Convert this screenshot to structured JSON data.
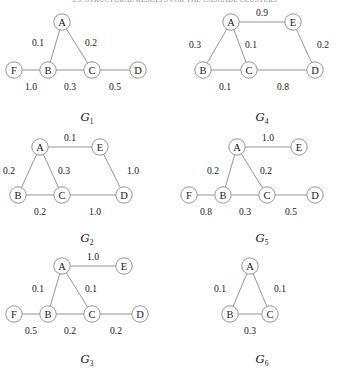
{
  "header": {
    "running_title": "3.3. STRUCTURAL RESULTS FOR THE CASCADE CLUSTERS"
  },
  "figure": {
    "node_radius": 8.2,
    "stroke_color": "#8a8a92",
    "background": "#ffffff",
    "graphs": [
      {
        "id": "G1",
        "caption_letter": "G",
        "caption_subscript": "1",
        "nodes": [
          {
            "label": "A",
            "x": 62,
            "y": 14
          },
          {
            "label": "B",
            "x": 48,
            "y": 62
          },
          {
            "label": "C",
            "x": 92,
            "y": 62
          },
          {
            "label": "D",
            "x": 138,
            "y": 62
          },
          {
            "label": "F",
            "x": 14,
            "y": 62
          }
        ],
        "edges": [
          {
            "from": "A",
            "to": "B",
            "weight": "0.1",
            "lx": 38,
            "ly": 34
          },
          {
            "from": "A",
            "to": "C",
            "weight": "0.2",
            "lx": 91,
            "ly": 34
          },
          {
            "from": "B",
            "to": "C",
            "weight": "0.3",
            "lx": 70,
            "ly": 78
          },
          {
            "from": "C",
            "to": "D",
            "weight": "0.5",
            "lx": 115,
            "ly": 78
          },
          {
            "from": "F",
            "to": "B",
            "weight": "1.0",
            "lx": 31,
            "ly": 78
          }
        ]
      },
      {
        "id": "G4",
        "caption_letter": "G",
        "caption_subscript": "4",
        "nodes": [
          {
            "label": "A",
            "x": 56,
            "y": 14
          },
          {
            "label": "E",
            "x": 118,
            "y": 14
          },
          {
            "label": "B",
            "x": 28,
            "y": 62
          },
          {
            "label": "C",
            "x": 74,
            "y": 62
          },
          {
            "label": "D",
            "x": 140,
            "y": 62
          }
        ],
        "edges": [
          {
            "from": "A",
            "to": "E",
            "weight": "0.9",
            "lx": 87,
            "ly": 4
          },
          {
            "from": "A",
            "to": "B",
            "weight": "0.3",
            "lx": 20,
            "ly": 36
          },
          {
            "from": "A",
            "to": "C",
            "weight": "0.1",
            "lx": 76,
            "ly": 36
          },
          {
            "from": "E",
            "to": "D",
            "weight": "0.2",
            "lx": 148,
            "ly": 36
          },
          {
            "from": "B",
            "to": "C",
            "weight": "0.1",
            "lx": 50,
            "ly": 78
          },
          {
            "from": "C",
            "to": "D",
            "weight": "0.8",
            "lx": 108,
            "ly": 78
          }
        ]
      },
      {
        "id": "G2",
        "caption_letter": "G",
        "caption_subscript": "2",
        "nodes": [
          {
            "label": "A",
            "x": 40,
            "y": 18
          },
          {
            "label": "E",
            "x": 100,
            "y": 18
          },
          {
            "label": "B",
            "x": 18,
            "y": 66
          },
          {
            "label": "C",
            "x": 62,
            "y": 66
          },
          {
            "label": "D",
            "x": 124,
            "y": 66
          }
        ],
        "edges": [
          {
            "from": "A",
            "to": "E",
            "weight": "0.1",
            "lx": 70,
            "ly": 8
          },
          {
            "from": "A",
            "to": "B",
            "weight": "0.2",
            "lx": 9,
            "ly": 41
          },
          {
            "from": "A",
            "to": "C",
            "weight": "0.3",
            "lx": 64,
            "ly": 41
          },
          {
            "from": "E",
            "to": "D",
            "weight": "1.0",
            "lx": 133,
            "ly": 41
          },
          {
            "from": "B",
            "to": "C",
            "weight": "0.2",
            "lx": 40,
            "ly": 82
          },
          {
            "from": "C",
            "to": "D",
            "weight": "1.0",
            "lx": 95,
            "ly": 82
          }
        ]
      },
      {
        "id": "G5",
        "caption_letter": "G",
        "caption_subscript": "5",
        "nodes": [
          {
            "label": "A",
            "x": 62,
            "y": 18
          },
          {
            "label": "E",
            "x": 124,
            "y": 18
          },
          {
            "label": "F",
            "x": 14,
            "y": 66
          },
          {
            "label": "B",
            "x": 48,
            "y": 66
          },
          {
            "label": "C",
            "x": 92,
            "y": 66
          },
          {
            "label": "D",
            "x": 140,
            "y": 66
          }
        ],
        "edges": [
          {
            "from": "A",
            "to": "E",
            "weight": "1.0",
            "lx": 93,
            "ly": 8
          },
          {
            "from": "A",
            "to": "B",
            "weight": "0.2",
            "lx": 38,
            "ly": 41
          },
          {
            "from": "A",
            "to": "C",
            "weight": "0.2",
            "lx": 91,
            "ly": 41
          },
          {
            "from": "F",
            "to": "B",
            "weight": "0.8",
            "lx": 31,
            "ly": 82
          },
          {
            "from": "B",
            "to": "C",
            "weight": "0.3",
            "lx": 70,
            "ly": 82
          },
          {
            "from": "C",
            "to": "D",
            "weight": "0.5",
            "lx": 116,
            "ly": 82
          }
        ]
      },
      {
        "id": "G3",
        "caption_letter": "G",
        "caption_subscript": "3",
        "nodes": [
          {
            "label": "A",
            "x": 62,
            "y": 16
          },
          {
            "label": "E",
            "x": 124,
            "y": 16
          },
          {
            "label": "F",
            "x": 14,
            "y": 64
          },
          {
            "label": "B",
            "x": 48,
            "y": 64
          },
          {
            "label": "C",
            "x": 92,
            "y": 64
          },
          {
            "label": "D",
            "x": 140,
            "y": 64
          }
        ],
        "edges": [
          {
            "from": "A",
            "to": "E",
            "weight": "1.0",
            "lx": 93,
            "ly": 6
          },
          {
            "from": "A",
            "to": "B",
            "weight": "0.1",
            "lx": 38,
            "ly": 38
          },
          {
            "from": "A",
            "to": "C",
            "weight": "0.1",
            "lx": 91,
            "ly": 38
          },
          {
            "from": "F",
            "to": "B",
            "weight": "0.5",
            "lx": 31,
            "ly": 80
          },
          {
            "from": "B",
            "to": "C",
            "weight": "0.2",
            "lx": 70,
            "ly": 80
          },
          {
            "from": "C",
            "to": "D",
            "weight": "0.2",
            "lx": 116,
            "ly": 80
          }
        ]
      },
      {
        "id": "G6",
        "caption_letter": "G",
        "caption_subscript": "6",
        "nodes": [
          {
            "label": "A",
            "x": 75,
            "y": 16
          },
          {
            "label": "B",
            "x": 55,
            "y": 64
          },
          {
            "label": "C",
            "x": 95,
            "y": 64
          }
        ],
        "edges": [
          {
            "from": "A",
            "to": "B",
            "weight": "0.1",
            "lx": 45,
            "ly": 38
          },
          {
            "from": "A",
            "to": "C",
            "weight": "0.1",
            "lx": 105,
            "ly": 38
          },
          {
            "from": "B",
            "to": "C",
            "weight": "0.3",
            "lx": 75,
            "ly": 80
          }
        ]
      }
    ]
  }
}
